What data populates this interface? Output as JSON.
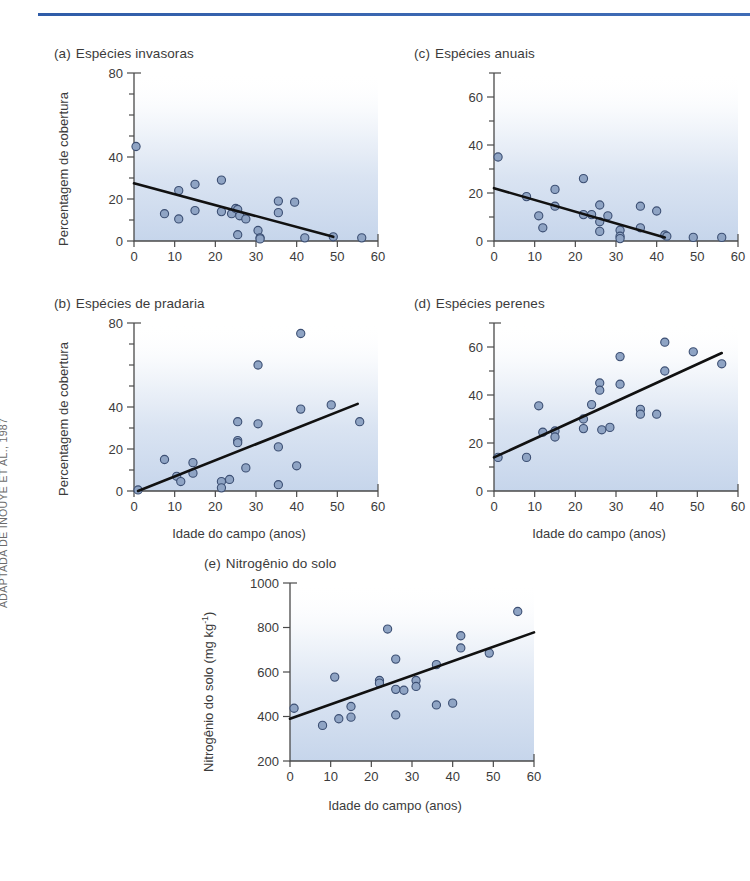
{
  "figure": {
    "credit": "ADAPTADA DE INOUYE ET AL., 1987",
    "axis_color": "#4a4a4a",
    "point_fill": "#8fa4c4",
    "point_stroke": "#3c4f73",
    "trend_color": "#111111",
    "rule_color": "#3a66b0",
    "shade_color": "#c3d3ea"
  },
  "panels": {
    "a": {
      "letter": "(a)",
      "title": "Espécies invasoras",
      "ylabel": "Percentagem de cobertura",
      "xlabel": ""
    },
    "b": {
      "letter": "(b)",
      "title": "Espécies de pradaria",
      "ylabel": "Percentagem de cobertura",
      "xlabel": "Idade do campo (anos)"
    },
    "c": {
      "letter": "(c)",
      "title": "Espécies anuais",
      "ylabel": "",
      "xlabel": ""
    },
    "d": {
      "letter": "(d)",
      "title": "Espécies perenes",
      "ylabel": "",
      "xlabel": "Idade do campo (anos)"
    },
    "e": {
      "letter": "(e)",
      "title": "Nitrogênio do solo",
      "ylabel_pre": "Nitrogênio do solo (mg kg",
      "ylabel_sup": "-1",
      "ylabel_post": ")",
      "xlabel": "Idade do campo (anos)"
    }
  },
  "chart_data": [
    {
      "id": "a",
      "type": "scatter",
      "title": "(a) Espécies invasoras",
      "xlabel": "",
      "ylabel": "Percentagem de cobertura",
      "xlim": [
        0,
        60
      ],
      "ylim": [
        0,
        80
      ],
      "xticks": [
        0,
        10,
        20,
        30,
        40,
        50,
        60
      ],
      "xticklabels": [
        "0",
        "10",
        "20",
        "30",
        "40",
        "50",
        "60"
      ],
      "yticks": [
        0,
        10,
        20,
        30,
        40,
        50,
        60,
        70,
        80
      ],
      "yticklabels": [
        "0",
        "",
        "20",
        "",
        "40",
        "",
        "",
        "",
        "80"
      ],
      "grid": false,
      "legend": null,
      "points": [
        [
          0.5,
          45
        ],
        [
          7.5,
          13
        ],
        [
          11,
          24
        ],
        [
          11,
          10.5
        ],
        [
          15,
          27
        ],
        [
          15,
          14.5
        ],
        [
          21.5,
          29
        ],
        [
          21.5,
          14
        ],
        [
          24,
          13
        ],
        [
          25,
          15.5
        ],
        [
          25.5,
          15
        ],
        [
          25.5,
          3
        ],
        [
          26,
          12
        ],
        [
          27.5,
          10.5
        ],
        [
          30.5,
          5
        ],
        [
          31,
          1.5
        ],
        [
          31,
          1
        ],
        [
          35.5,
          19
        ],
        [
          35.5,
          13.5
        ],
        [
          39.5,
          18.5
        ],
        [
          42,
          1.5
        ],
        [
          49,
          2
        ],
        [
          56,
          1.5
        ]
      ],
      "trendline": {
        "x": [
          0,
          49
        ],
        "y": [
          27.5,
          2
        ],
        "slope": -0.52,
        "intercept": 27.5
      }
    },
    {
      "id": "b",
      "type": "scatter",
      "title": "(b) Espécies de pradaria",
      "xlabel": "Idade do campo (anos)",
      "ylabel": "Percentagem de cobertura",
      "xlim": [
        0,
        60
      ],
      "ylim": [
        0,
        80
      ],
      "xticks": [
        0,
        10,
        20,
        30,
        40,
        50,
        60
      ],
      "xticklabels": [
        "0",
        "10",
        "20",
        "30",
        "40",
        "50",
        "60"
      ],
      "yticks": [
        0,
        10,
        20,
        30,
        40,
        50,
        60,
        70,
        80
      ],
      "yticklabels": [
        "0",
        "",
        "20",
        "",
        "40",
        "",
        "",
        "",
        "80"
      ],
      "grid": false,
      "legend": null,
      "points": [
        [
          1,
          0.5
        ],
        [
          7.5,
          15
        ],
        [
          10.5,
          7
        ],
        [
          11.5,
          4.5
        ],
        [
          14.5,
          13.5
        ],
        [
          14.5,
          8.5
        ],
        [
          21.5,
          4.5
        ],
        [
          21.5,
          1.5
        ],
        [
          23.5,
          5.5
        ],
        [
          25.5,
          33
        ],
        [
          25.5,
          24
        ],
        [
          25.5,
          23
        ],
        [
          27.5,
          11
        ],
        [
          30.5,
          60
        ],
        [
          30.5,
          32
        ],
        [
          35.5,
          21
        ],
        [
          35.5,
          3
        ],
        [
          40,
          12
        ],
        [
          41,
          75
        ],
        [
          41,
          39
        ],
        [
          48.5,
          41
        ],
        [
          55.5,
          33
        ]
      ],
      "trendline": {
        "x": [
          1,
          55
        ],
        "y": [
          0,
          41.5
        ],
        "slope": 0.77,
        "intercept": -0.77
      }
    },
    {
      "id": "c",
      "type": "scatter",
      "title": "(c) Espécies anuais",
      "xlabel": "",
      "ylabel": "",
      "xlim": [
        0,
        60
      ],
      "ylim": [
        0,
        70
      ],
      "xticks": [
        0,
        10,
        20,
        30,
        40,
        50,
        60
      ],
      "xticklabels": [
        "0",
        "10",
        "20",
        "30",
        "40",
        "50",
        "60"
      ],
      "yticks": [
        0,
        10,
        20,
        30,
        40,
        50,
        60,
        70
      ],
      "yticklabels": [
        "0",
        "",
        "20",
        "",
        "40",
        "",
        "60",
        ""
      ],
      "grid": false,
      "legend": null,
      "points": [
        [
          1,
          35
        ],
        [
          8,
          18.5
        ],
        [
          11,
          10.5
        ],
        [
          12,
          5.5
        ],
        [
          15,
          21.5
        ],
        [
          15,
          14.5
        ],
        [
          22,
          26
        ],
        [
          22,
          11
        ],
        [
          24,
          11
        ],
        [
          26,
          15
        ],
        [
          26,
          8
        ],
        [
          26,
          4
        ],
        [
          28,
          10.5
        ],
        [
          31,
          4.5
        ],
        [
          31,
          2
        ],
        [
          31,
          1
        ],
        [
          36,
          14.5
        ],
        [
          36,
          5.5
        ],
        [
          40,
          12.5
        ],
        [
          42,
          2.5
        ],
        [
          42.5,
          2
        ],
        [
          49,
          1.5
        ],
        [
          56,
          1.5
        ]
      ],
      "trendline": {
        "x": [
          0,
          42
        ],
        "y": [
          22,
          1.5
        ],
        "slope": -0.49,
        "intercept": 22
      }
    },
    {
      "id": "d",
      "type": "scatter",
      "title": "(d) Espécies perenes",
      "xlabel": "Idade do campo (anos)",
      "ylabel": "",
      "xlim": [
        0,
        60
      ],
      "ylim": [
        0,
        70
      ],
      "xticks": [
        0,
        10,
        20,
        30,
        40,
        50,
        60
      ],
      "xticklabels": [
        "0",
        "10",
        "20",
        "30",
        "40",
        "50",
        "60"
      ],
      "yticks": [
        0,
        10,
        20,
        30,
        40,
        50,
        60,
        70
      ],
      "yticklabels": [
        "0",
        "",
        "20",
        "",
        "40",
        "",
        "60",
        ""
      ],
      "grid": false,
      "legend": null,
      "points": [
        [
          1,
          14
        ],
        [
          8,
          14
        ],
        [
          11,
          35.5
        ],
        [
          12,
          24.5
        ],
        [
          15,
          25
        ],
        [
          15,
          22.5
        ],
        [
          22,
          30
        ],
        [
          22,
          26
        ],
        [
          24,
          36
        ],
        [
          26,
          45
        ],
        [
          26,
          42
        ],
        [
          26.5,
          25.5
        ],
        [
          28.5,
          26.5
        ],
        [
          31,
          56
        ],
        [
          31,
          44.5
        ],
        [
          36,
          34
        ],
        [
          36,
          32
        ],
        [
          40,
          32
        ],
        [
          42,
          62
        ],
        [
          42,
          50
        ],
        [
          49,
          58
        ],
        [
          56,
          53
        ]
      ],
      "trendline": {
        "x": [
          0,
          56
        ],
        "y": [
          14,
          57.5
        ],
        "slope": 0.78,
        "intercept": 14
      }
    },
    {
      "id": "e",
      "type": "scatter",
      "title": "(e) Nitrogênio do solo",
      "xlabel": "Idade do campo (anos)",
      "ylabel": "Nitrogênio do solo (mg kg-1)",
      "xlim": [
        0,
        60
      ],
      "ylim": [
        200,
        1000
      ],
      "xticks": [
        0,
        10,
        20,
        30,
        40,
        50,
        60
      ],
      "xticklabels": [
        "0",
        "10",
        "20",
        "30",
        "40",
        "50",
        "60"
      ],
      "yticks": [
        200,
        400,
        600,
        800,
        1000
      ],
      "yticklabels": [
        "200",
        "400",
        "600",
        "800",
        "1000"
      ],
      "grid": false,
      "legend": null,
      "points": [
        [
          1,
          437
        ],
        [
          8,
          360
        ],
        [
          11,
          577
        ],
        [
          12,
          390
        ],
        [
          15,
          445
        ],
        [
          15,
          397
        ],
        [
          22,
          562
        ],
        [
          22,
          550
        ],
        [
          24,
          793
        ],
        [
          26,
          658
        ],
        [
          26,
          522
        ],
        [
          26,
          407
        ],
        [
          28,
          518
        ],
        [
          31,
          562
        ],
        [
          31,
          535
        ],
        [
          36,
          633
        ],
        [
          36,
          452
        ],
        [
          40,
          460
        ],
        [
          42,
          763
        ],
        [
          42,
          708
        ],
        [
          49,
          685
        ],
        [
          56,
          872
        ]
      ],
      "trendline": {
        "x": [
          0,
          60
        ],
        "y": [
          390,
          778
        ],
        "slope": 6.47,
        "intercept": 390
      }
    }
  ]
}
